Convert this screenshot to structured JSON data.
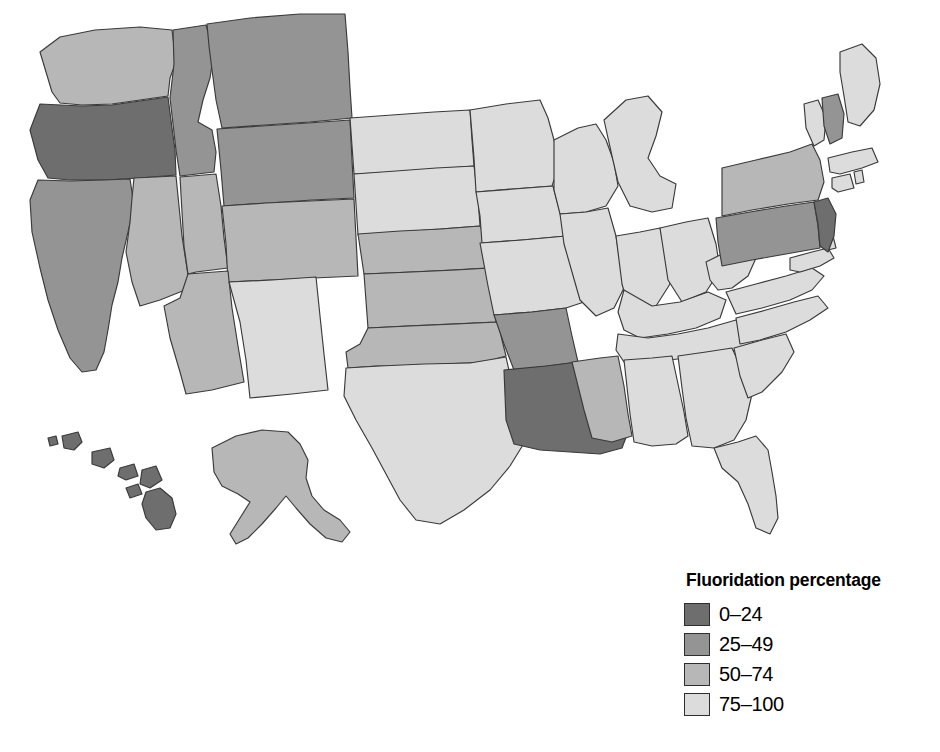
{
  "figure": {
    "type": "choropleth-map",
    "region": "United States",
    "background_color": "#ffffff",
    "border_color": "#3a3a3a"
  },
  "legend": {
    "title": "Fluoridation percentage",
    "position": "bottom-right",
    "items": [
      {
        "label": "0–24",
        "color": "#6e6e6e",
        "range": [
          0,
          24
        ]
      },
      {
        "label": "25–49",
        "color": "#949494",
        "range": [
          25,
          49
        ]
      },
      {
        "label": "50–74",
        "color": "#b7b7b7",
        "range": [
          50,
          74
        ]
      },
      {
        "label": "75–100",
        "color": "#dcdcdc",
        "range": [
          75,
          100
        ]
      }
    ]
  },
  "chart_data": {
    "type": "choropleth",
    "title": "Fluoridation percentage",
    "value_field": "fluoridation_percentage_class",
    "classes": [
      "0–24",
      "25–49",
      "50–74",
      "75–100"
    ],
    "class_colors": [
      "#6e6e6e",
      "#949494",
      "#b7b7b7",
      "#dcdcdc"
    ],
    "states": [
      {
        "code": "OR",
        "name": "Oregon",
        "class": "0–24"
      },
      {
        "code": "NJ",
        "name": "New Jersey",
        "class": "0–24"
      },
      {
        "code": "LA",
        "name": "Louisiana",
        "class": "0–24"
      },
      {
        "code": "HI",
        "name": "Hawaii",
        "class": "0–24"
      },
      {
        "code": "MT",
        "name": "Montana",
        "class": "25–49"
      },
      {
        "code": "ID",
        "name": "Idaho",
        "class": "25–49"
      },
      {
        "code": "WY",
        "name": "Wyoming",
        "class": "25–49"
      },
      {
        "code": "CA",
        "name": "California",
        "class": "25–49"
      },
      {
        "code": "AR",
        "name": "Arkansas",
        "class": "25–49"
      },
      {
        "code": "PA",
        "name": "Pennsylvania",
        "class": "25–49"
      },
      {
        "code": "NH",
        "name": "New Hampshire",
        "class": "25–49"
      },
      {
        "code": "WA",
        "name": "Washington",
        "class": "50–74"
      },
      {
        "code": "NV",
        "name": "Nevada",
        "class": "50–74"
      },
      {
        "code": "UT",
        "name": "Utah",
        "class": "50–74"
      },
      {
        "code": "AZ",
        "name": "Arizona",
        "class": "50–74"
      },
      {
        "code": "CO",
        "name": "Colorado",
        "class": "50–74"
      },
      {
        "code": "NE",
        "name": "Nebraska",
        "class": "50–74"
      },
      {
        "code": "KS",
        "name": "Kansas",
        "class": "50–74"
      },
      {
        "code": "OK",
        "name": "Oklahoma",
        "class": "50–74"
      },
      {
        "code": "MS",
        "name": "Mississippi",
        "class": "50–74"
      },
      {
        "code": "NY",
        "name": "New York",
        "class": "50–74"
      },
      {
        "code": "AK",
        "name": "Alaska",
        "class": "50–74"
      },
      {
        "code": "ND",
        "name": "North Dakota",
        "class": "75–100"
      },
      {
        "code": "SD",
        "name": "South Dakota",
        "class": "75–100"
      },
      {
        "code": "MN",
        "name": "Minnesota",
        "class": "75–100"
      },
      {
        "code": "IA",
        "name": "Iowa",
        "class": "75–100"
      },
      {
        "code": "WI",
        "name": "Wisconsin",
        "class": "75–100"
      },
      {
        "code": "MI",
        "name": "Michigan",
        "class": "75–100"
      },
      {
        "code": "IL",
        "name": "Illinois",
        "class": "75–100"
      },
      {
        "code": "IN",
        "name": "Indiana",
        "class": "75–100"
      },
      {
        "code": "OH",
        "name": "Ohio",
        "class": "75–100"
      },
      {
        "code": "MO",
        "name": "Missouri",
        "class": "75–100"
      },
      {
        "code": "KY",
        "name": "Kentucky",
        "class": "75–100"
      },
      {
        "code": "TN",
        "name": "Tennessee",
        "class": "75–100"
      },
      {
        "code": "WV",
        "name": "West Virginia",
        "class": "75–100"
      },
      {
        "code": "VA",
        "name": "Virginia",
        "class": "75–100"
      },
      {
        "code": "MD",
        "name": "Maryland",
        "class": "75–100"
      },
      {
        "code": "DE",
        "name": "Delaware",
        "class": "75–100"
      },
      {
        "code": "NC",
        "name": "North Carolina",
        "class": "75–100"
      },
      {
        "code": "SC",
        "name": "South Carolina",
        "class": "75–100"
      },
      {
        "code": "GA",
        "name": "Georgia",
        "class": "75–100"
      },
      {
        "code": "FL",
        "name": "Florida",
        "class": "75–100"
      },
      {
        "code": "AL",
        "name": "Alabama",
        "class": "75–100"
      },
      {
        "code": "TX",
        "name": "Texas",
        "class": "75–100"
      },
      {
        "code": "NM",
        "name": "New Mexico",
        "class": "75–100"
      },
      {
        "code": "ME",
        "name": "Maine",
        "class": "75–100"
      },
      {
        "code": "VT",
        "name": "Vermont",
        "class": "75–100"
      },
      {
        "code": "MA",
        "name": "Massachusetts",
        "class": "75–100"
      },
      {
        "code": "CT",
        "name": "Connecticut",
        "class": "75–100"
      },
      {
        "code": "RI",
        "name": "Rhode Island",
        "class": "75–100"
      }
    ]
  }
}
